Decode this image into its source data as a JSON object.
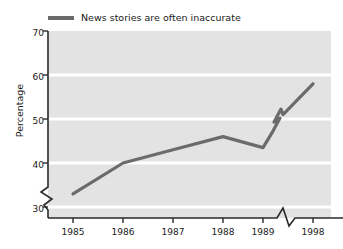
{
  "chart_data": {
    "type": "line",
    "title": "",
    "subtitle": "",
    "xlabel": "",
    "ylabel": "Percentage",
    "grid": true,
    "legend_position": "top-left",
    "ylim": [
      26,
      70
    ],
    "yticks": [
      30,
      40,
      50,
      60,
      70
    ],
    "axis_break_y": true,
    "axis_break_x": true,
    "axis_break_x_between": [
      "1989",
      "1998"
    ],
    "categories": [
      "1985",
      "1986",
      "1987",
      "1988",
      "1989",
      "",
      "1998"
    ],
    "x": [
      "1985",
      "1986",
      "1987",
      "1988",
      "1989",
      "break",
      "1998"
    ],
    "series": [
      {
        "name": "News stories are often inaccurate",
        "color": "#6b6b6b",
        "values": [
          33,
          40,
          43,
          46,
          43.5,
          51,
          58
        ]
      }
    ],
    "legend": [
      "News stories are often inaccurate"
    ]
  },
  "legend": {
    "label": "News stories are often inaccurate",
    "swatch_name": "legend-line-swatch"
  },
  "axes": {
    "y_axis_title": "Percentage",
    "y_ticks": [
      "30",
      "40",
      "50",
      "60",
      "70"
    ],
    "x_ticks": [
      "1985",
      "1986",
      "1987",
      "1988",
      "1989",
      "1998"
    ]
  },
  "colors": {
    "line": "#6b6b6b",
    "plot_background": "#e3e3e3",
    "gridline": "#ffffff",
    "axis": "#2b2b2b",
    "text": "#1a1a1a"
  }
}
